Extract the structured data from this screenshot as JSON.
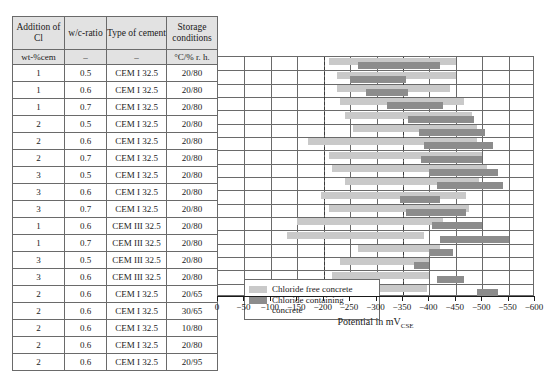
{
  "table": {
    "headers": [
      "Addition of Cl",
      "w/c-ratio",
      "Type of cement",
      "Storage conditions"
    ],
    "units": [
      "wt-%cem",
      "–",
      "–",
      "°C/% r. h."
    ],
    "rows": [
      {
        "addition": "1",
        "wc": "0.5",
        "cement": "CEM I 32.5",
        "storage": "20/80"
      },
      {
        "addition": "1",
        "wc": "0.6",
        "cement": "CEM I 32.5",
        "storage": "20/80"
      },
      {
        "addition": "1",
        "wc": "0.7",
        "cement": "CEM I 32.5",
        "storage": "20/80"
      },
      {
        "addition": "2",
        "wc": "0.5",
        "cement": "CEM I 32.5",
        "storage": "20/80"
      },
      {
        "addition": "2",
        "wc": "0.6",
        "cement": "CEM I 32.5",
        "storage": "20/80"
      },
      {
        "addition": "2",
        "wc": "0.7",
        "cement": "CEM I 32.5",
        "storage": "20/80"
      },
      {
        "addition": "3",
        "wc": "0.5",
        "cement": "CEM I 32.5",
        "storage": "20/80"
      },
      {
        "addition": "3",
        "wc": "0.6",
        "cement": "CEM I 32.5",
        "storage": "20/80"
      },
      {
        "addition": "3",
        "wc": "0.7",
        "cement": "CEM I 32.5",
        "storage": "20/80"
      },
      {
        "addition": "1",
        "wc": "0.6",
        "cement": "CEM III 32.5",
        "storage": "20/80"
      },
      {
        "addition": "1",
        "wc": "0.7",
        "cement": "CEM III 32.5",
        "storage": "20/80"
      },
      {
        "addition": "3",
        "wc": "0.5",
        "cement": "CEM III 32.5",
        "storage": "20/80"
      },
      {
        "addition": "3",
        "wc": "0.6",
        "cement": "CEM III 32.5",
        "storage": "20/80"
      },
      {
        "addition": "2",
        "wc": "0.6",
        "cement": "CEM I 32.5",
        "storage": "20/65"
      },
      {
        "addition": "2",
        "wc": "0.6",
        "cement": "CEM I 32.5",
        "storage": "30/65"
      },
      {
        "addition": "2",
        "wc": "0.6",
        "cement": "CEM I 32.5",
        "storage": "10/80"
      },
      {
        "addition": "2",
        "wc": "0.6",
        "cement": "CEM I 32.5",
        "storage": "20/80"
      },
      {
        "addition": "2",
        "wc": "0.6",
        "cement": "CEM I 32.5",
        "storage": "20/95"
      }
    ]
  },
  "legend": {
    "position": "inside-lower-left",
    "items": [
      {
        "key": "free",
        "label": "Chloride free concrete",
        "color": "#c9c9c9"
      },
      {
        "key": "cl",
        "label": "Chloride containing concrete",
        "color": "#8c8c8c"
      }
    ]
  },
  "chart_data": {
    "type": "bar",
    "orientation": "horizontal-range",
    "title": "",
    "xlabel": "Potential in mV_CSE",
    "ylabel": "",
    "xlim": [
      0,
      -600
    ],
    "xticks": [
      0,
      -50,
      -100,
      -150,
      -200,
      -250,
      -300,
      -350,
      -400,
      -450,
      -500,
      -550,
      -600
    ],
    "xtick_labels": [
      "0",
      "−50",
      "−100",
      "−150",
      "−200",
      "−250",
      "−300",
      "−350",
      "−400",
      "−450",
      "−500",
      "−550",
      "−600"
    ],
    "gridlines_x": [
      -50,
      -100,
      -150,
      -200,
      -250,
      -300,
      -350,
      -400,
      -450,
      -500,
      -550
    ],
    "dashed_reference_lines": [
      -200,
      -350
    ],
    "grid": true,
    "series": [
      {
        "name": "Chloride free concrete",
        "color": "#c9c9c9"
      },
      {
        "name": "Chloride containing concrete",
        "color": "#8c8c8c"
      }
    ],
    "categories": [
      "1 / 0.5 / CEM I 32.5 / 20/80",
      "1 / 0.6 / CEM I 32.5 / 20/80",
      "1 / 0.7 / CEM I 32.5 / 20/80",
      "2 / 0.5 / CEM I 32.5 / 20/80",
      "2 / 0.6 / CEM I 32.5 / 20/80",
      "2 / 0.7 / CEM I 32.5 / 20/80",
      "3 / 0.5 / CEM I 32.5 / 20/80",
      "3 / 0.6 / CEM I 32.5 / 20/80",
      "3 / 0.7 / CEM I 32.5 / 20/80",
      "1 / 0.6 / CEM III 32.5 / 20/80",
      "1 / 0.7 / CEM III 32.5 / 20/80",
      "3 / 0.5 / CEM III 32.5 / 20/80",
      "3 / 0.6 / CEM III 32.5 / 20/80",
      "2 / 0.6 / CEM I 32.5 / 20/65",
      "2 / 0.6 / CEM I 32.5 / 30/65",
      "2 / 0.6 / CEM I 32.5 / 10/80",
      "2 / 0.6 / CEM I 32.5 / 20/80",
      "2 / 0.6 / CEM I 32.5 / 20/95"
    ],
    "bars": [
      {
        "row": 0,
        "free": [
          -210,
          -450
        ],
        "cl": [
          -265,
          -420
        ]
      },
      {
        "row": 1,
        "free": [
          -225,
          -450
        ],
        "cl": [
          -250,
          -355
        ]
      },
      {
        "row": 2,
        "free": [
          -225,
          -440
        ],
        "cl": [
          -280,
          -360
        ]
      },
      {
        "row": 3,
        "free": [
          -230,
          -465
        ],
        "cl": [
          -320,
          -425
        ]
      },
      {
        "row": 4,
        "free": [
          -240,
          -480
        ],
        "cl": [
          -360,
          -485
        ]
      },
      {
        "row": 5,
        "free": [
          -255,
          -490
        ],
        "cl": [
          -380,
          -505
        ]
      },
      {
        "row": 6,
        "free": [
          -170,
          -490
        ],
        "cl": [
          -390,
          -520
        ]
      },
      {
        "row": 7,
        "free": [
          -210,
          -500
        ],
        "cl": [
          -385,
          -500
        ]
      },
      {
        "row": 8,
        "free": [
          -215,
          -510
        ],
        "cl": [
          -400,
          -530
        ]
      },
      {
        "row": 9,
        "free": [
          -240,
          -495
        ],
        "cl": [
          -415,
          -540
        ]
      },
      {
        "row": 10,
        "free": [
          -195,
          -470
        ],
        "cl": [
          -345,
          -420
        ]
      },
      {
        "row": 11,
        "free": [
          -210,
          -475
        ],
        "cl": [
          -355,
          -470
        ]
      },
      {
        "row": 12,
        "free": [
          -150,
          -425
        ],
        "cl": [
          -405,
          -500
        ]
      },
      {
        "row": 13,
        "free": [
          -130,
          -390
        ],
        "cl": [
          -420,
          -550
        ]
      },
      {
        "row": 14,
        "free": [
          -265,
          -420
        ],
        "cl": [
          -400,
          -445
        ]
      },
      {
        "row": 15,
        "free": [
          -230,
          -400
        ],
        "cl": [
          -370,
          -400
        ]
      },
      {
        "row": 16,
        "free": [
          -215,
          -400
        ],
        "cl": [
          -415,
          -465
        ]
      },
      {
        "row": 17,
        "free": [
          -175,
          -395
        ],
        "cl": [
          -490,
          -530
        ]
      }
    ]
  }
}
